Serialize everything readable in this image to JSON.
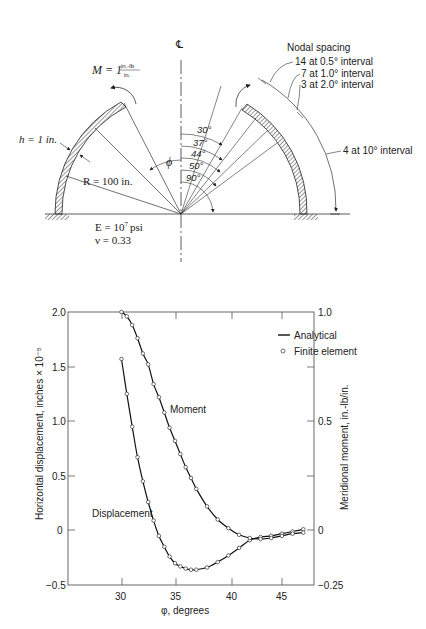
{
  "diagram": {
    "centerline_symbol": "℄",
    "moment_label": "M = 1",
    "moment_unit_num": "in.-lb",
    "moment_unit_den": "in.",
    "thickness_label": "h = 1 in.",
    "radius_label": "R = 100 in.",
    "phi_label": "ϕ",
    "modulus_label": "E = 10",
    "modulus_exp": "7",
    "modulus_unit": "psi",
    "poisson_label": "ν = 0.33",
    "angles": [
      "30°",
      "37°",
      "44°",
      "50°",
      "90°"
    ],
    "nodal_spacing_title": "Nodal spacing",
    "nodal_spacing": [
      "14 at 0.5° interval",
      "7 at 1.0° interval",
      "3 at 2.0° interval",
      "4 at 10° interval"
    ]
  },
  "chart_data": {
    "type": "line",
    "title": "",
    "xlabel": "φ, degrees",
    "ylabel": "Horizontal displacement, inches × 10⁻⁵",
    "ylabel_right": "Meridional moment, in.-lb/in.",
    "xlim": [
      25,
      48
    ],
    "ylim": [
      -0.5,
      2.0
    ],
    "ylim_right": [
      -0.25,
      1.0
    ],
    "x_ticks": [
      "30",
      "35",
      "40",
      "45"
    ],
    "y_ticks": [
      "−0.5",
      "0",
      "0.5",
      "1.0",
      "1.5",
      "2.0"
    ],
    "y_ticks_right": [
      "−0.25",
      "0",
      "0.5",
      "1.0"
    ],
    "legend": [
      {
        "label": "Analytical",
        "style": "solid-line"
      },
      {
        "label": "Finite element",
        "style": "open-circle"
      }
    ],
    "legend_position": "upper right",
    "grid": false,
    "annotations": [
      "Moment",
      "Displacement"
    ],
    "series": [
      {
        "name": "Displacement (left axis)",
        "x": [
          30.0,
          30.5,
          31.0,
          31.5,
          32.0,
          32.5,
          33.0,
          33.5,
          34.0,
          34.5,
          35.0,
          35.5,
          36.0,
          36.5,
          37.0,
          38.0,
          39.0,
          40.0,
          41.0,
          42.0,
          43.0,
          44.0,
          45.0,
          46.0,
          47.0
        ],
        "values": [
          1.57,
          1.25,
          0.95,
          0.67,
          0.45,
          0.26,
          0.09,
          -0.05,
          -0.15,
          -0.24,
          -0.3,
          -0.33,
          -0.35,
          -0.36,
          -0.36,
          -0.34,
          -0.29,
          -0.23,
          -0.16,
          -0.09,
          -0.06,
          -0.05,
          -0.03,
          -0.01,
          0.01
        ]
      },
      {
        "name": "Moment (right axis)",
        "x": [
          30.0,
          30.5,
          31.0,
          31.5,
          32.0,
          32.5,
          33.0,
          33.5,
          34.0,
          34.5,
          35.0,
          35.5,
          36.0,
          36.5,
          37.0,
          38.0,
          39.0,
          40.0,
          41.0,
          42.0,
          43.0,
          44.0,
          45.0,
          46.0,
          47.0
        ],
        "values": [
          1.0,
          0.98,
          0.94,
          0.88,
          0.81,
          0.76,
          0.67,
          0.61,
          0.54,
          0.47,
          0.41,
          0.35,
          0.29,
          0.24,
          0.19,
          0.11,
          0.05,
          0.01,
          -0.02,
          -0.035,
          -0.04,
          -0.035,
          -0.025,
          -0.015,
          -0.01
        ]
      }
    ]
  }
}
